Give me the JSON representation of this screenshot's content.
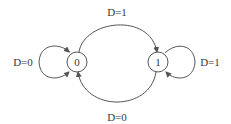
{
  "diagram": {
    "type": "state-machine",
    "colors": {
      "stroke": "#555555",
      "text": "#3a3a3a",
      "background": "#ffffff"
    },
    "states": [
      {
        "id": "s0",
        "label": "0"
      },
      {
        "id": "s1",
        "label": "1"
      }
    ],
    "transitions": [
      {
        "from": "0",
        "to": "0",
        "label": "D=0"
      },
      {
        "from": "0",
        "to": "1",
        "label": "D=1"
      },
      {
        "from": "1",
        "to": "1",
        "label": "D=1"
      },
      {
        "from": "1",
        "to": "0",
        "label": "D=0"
      }
    ]
  }
}
